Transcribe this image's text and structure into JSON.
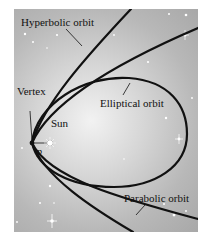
{
  "figure": {
    "labels": {
      "hyperbolic": "Hyperbolic orbit",
      "elliptical": "Elliptical orbit",
      "parabolic": "Parabolic orbit",
      "vertex": "Vertex",
      "sun": "Sun",
      "p": "p"
    },
    "colors": {
      "curve": "#111111",
      "background_center": "#f2f2f2",
      "background_edge": "#a8a8a8",
      "stars": "#ffffff"
    }
  }
}
